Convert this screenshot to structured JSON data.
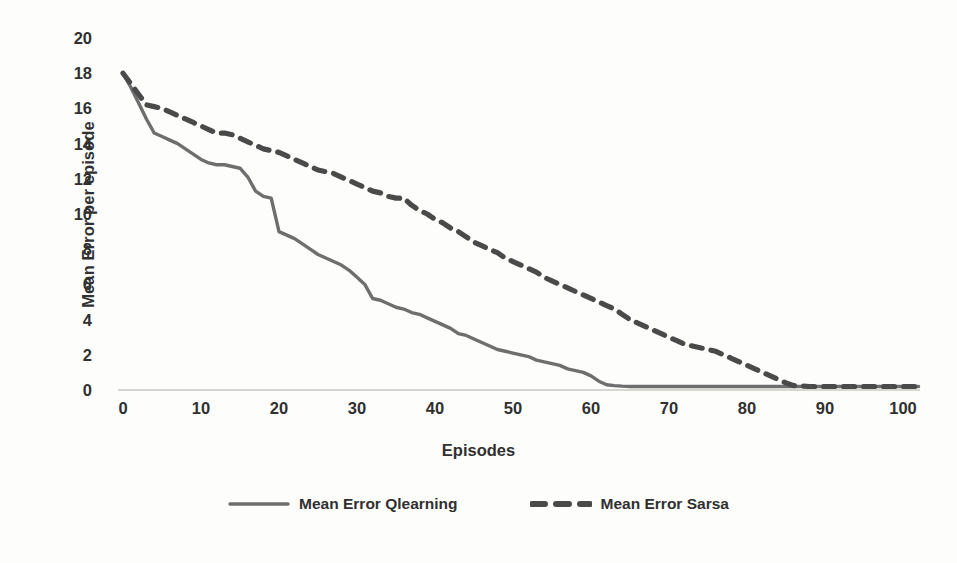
{
  "chart_data": {
    "type": "line",
    "title": "",
    "xlabel": "Episodes",
    "ylabel": "Mean Error per episode",
    "xlim": [
      0,
      102
    ],
    "ylim": [
      0,
      20
    ],
    "xticks": [
      0,
      10,
      20,
      30,
      40,
      50,
      60,
      70,
      80,
      90,
      100
    ],
    "yticks": [
      0,
      2,
      4,
      6,
      8,
      10,
      12,
      14,
      16,
      18,
      20
    ],
    "grid": false,
    "legend_position": "bottom",
    "series": [
      {
        "name": "Mean Error Qlearning",
        "style": "solid",
        "color": "#6e6e6e",
        "x": [
          0,
          1,
          2,
          3,
          4,
          5,
          6,
          7,
          8,
          9,
          10,
          11,
          12,
          13,
          14,
          15,
          16,
          17,
          18,
          19,
          20,
          21,
          22,
          23,
          24,
          25,
          26,
          27,
          28,
          29,
          30,
          31,
          32,
          33,
          34,
          35,
          36,
          37,
          38,
          39,
          40,
          41,
          42,
          43,
          44,
          45,
          46,
          47,
          48,
          49,
          50,
          51,
          52,
          53,
          54,
          55,
          56,
          57,
          58,
          59,
          60,
          61,
          62,
          63,
          64,
          65,
          70,
          75,
          80,
          85,
          90,
          95,
          100,
          102
        ],
        "values": [
          18.0,
          17.2,
          16.3,
          15.4,
          14.6,
          14.4,
          14.2,
          14.0,
          13.7,
          13.4,
          13.1,
          12.9,
          12.8,
          12.8,
          12.7,
          12.6,
          12.1,
          11.3,
          11.0,
          10.9,
          9.0,
          8.8,
          8.6,
          8.3,
          8.0,
          7.7,
          7.5,
          7.3,
          7.1,
          6.8,
          6.4,
          6.0,
          5.2,
          5.1,
          4.9,
          4.7,
          4.6,
          4.4,
          4.3,
          4.1,
          3.9,
          3.7,
          3.5,
          3.2,
          3.1,
          2.9,
          2.7,
          2.5,
          2.3,
          2.2,
          2.1,
          2.0,
          1.9,
          1.7,
          1.6,
          1.5,
          1.4,
          1.2,
          1.1,
          1.0,
          0.8,
          0.5,
          0.3,
          0.25,
          0.22,
          0.2,
          0.2,
          0.2,
          0.2,
          0.2,
          0.2,
          0.2,
          0.2,
          0.2
        ]
      },
      {
        "name": "Mean Error Sarsa",
        "style": "dashed",
        "color": "#4a4a4a",
        "x": [
          0,
          1,
          2,
          3,
          4,
          5,
          6,
          7,
          8,
          9,
          10,
          11,
          12,
          13,
          14,
          15,
          16,
          17,
          18,
          19,
          20,
          21,
          22,
          23,
          24,
          25,
          26,
          27,
          28,
          29,
          30,
          31,
          32,
          33,
          34,
          35,
          36,
          37,
          38,
          39,
          40,
          41,
          42,
          43,
          44,
          45,
          46,
          47,
          48,
          49,
          50,
          51,
          52,
          53,
          54,
          55,
          56,
          57,
          58,
          59,
          60,
          61,
          62,
          63,
          64,
          65,
          66,
          67,
          68,
          69,
          70,
          71,
          72,
          73,
          74,
          75,
          76,
          77,
          78,
          79,
          80,
          81,
          82,
          83,
          84,
          85,
          86,
          88,
          90,
          95,
          100,
          102
        ],
        "values": [
          18.0,
          17.4,
          16.8,
          16.2,
          16.1,
          16.0,
          15.8,
          15.6,
          15.4,
          15.2,
          15.0,
          14.8,
          14.6,
          14.6,
          14.5,
          14.3,
          14.1,
          13.9,
          13.7,
          13.6,
          13.5,
          13.3,
          13.1,
          12.9,
          12.7,
          12.5,
          12.4,
          12.3,
          12.1,
          11.9,
          11.7,
          11.5,
          11.3,
          11.2,
          11.0,
          10.9,
          10.9,
          10.5,
          10.2,
          10.0,
          9.7,
          9.5,
          9.2,
          9.0,
          8.7,
          8.4,
          8.2,
          8.0,
          7.8,
          7.5,
          7.3,
          7.1,
          6.9,
          6.7,
          6.4,
          6.2,
          6.0,
          5.8,
          5.6,
          5.4,
          5.2,
          5.0,
          4.8,
          4.6,
          4.3,
          4.0,
          3.8,
          3.6,
          3.4,
          3.2,
          3.0,
          2.8,
          2.6,
          2.5,
          2.4,
          2.3,
          2.2,
          2.0,
          1.8,
          1.6,
          1.4,
          1.2,
          1.0,
          0.8,
          0.6,
          0.4,
          0.25,
          0.2,
          0.2,
          0.2,
          0.2,
          0.2
        ]
      }
    ]
  },
  "axes": {
    "y_title": "Mean Error per episode",
    "x_title": "Episodes"
  },
  "legend": {
    "items": [
      {
        "label": "Mean Error Qlearning",
        "style": "solid",
        "color": "#6e6e6e"
      },
      {
        "label": "Mean Error Sarsa",
        "style": "dashed",
        "color": "#4a4a4a"
      }
    ]
  },
  "colors": {
    "qlearning": "#6e6e6e",
    "sarsa": "#4a4a4a",
    "baseline": "#c9c9c4",
    "background": "#fdfdfc",
    "text": "#303030"
  }
}
